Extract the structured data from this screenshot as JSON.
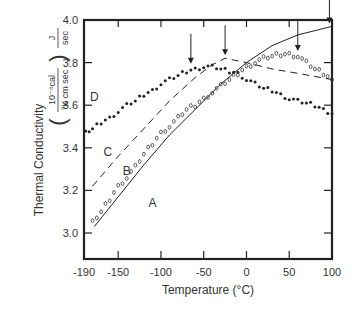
{
  "chart_data": {
    "type": "line",
    "title": "",
    "xlabel": "Temperature (°C)",
    "ylabel": "Thermal Conductivity",
    "ylabel_units": [
      "10⁻⁶cal",
      "°K cm sec"
    ],
    "ylabel_extra": "J / sec",
    "xlim": [
      -190,
      100
    ],
    "ylim": [
      2.9,
      4.0
    ],
    "xticks": [
      -190,
      -150,
      -100,
      -50,
      0,
      50,
      100
    ],
    "yticks": [
      3.0,
      3.2,
      3.4,
      3.6,
      3.8,
      4.0
    ],
    "grid": false,
    "series": [
      {
        "name": "A",
        "style": "solid",
        "x": [
          -178,
          -150,
          -120,
          -90,
          -60,
          -30,
          0,
          30,
          60,
          100
        ],
        "y": [
          3.03,
          3.17,
          3.32,
          3.46,
          3.58,
          3.7,
          3.8,
          3.88,
          3.93,
          3.97
        ]
      },
      {
        "name": "B",
        "style": "open-circles",
        "x": [
          -180,
          -170,
          -160,
          -150,
          -140,
          -130,
          -120,
          -110,
          -100,
          -90,
          -80,
          -70,
          -60,
          -50,
          -40,
          -30,
          -20,
          -10,
          0,
          10,
          20,
          30,
          40,
          50,
          60,
          70,
          80,
          90,
          100
        ],
        "y": [
          3.05,
          3.1,
          3.16,
          3.22,
          3.26,
          3.31,
          3.37,
          3.42,
          3.47,
          3.5,
          3.54,
          3.58,
          3.6,
          3.63,
          3.66,
          3.69,
          3.72,
          3.75,
          3.78,
          3.8,
          3.82,
          3.83,
          3.84,
          3.84,
          3.83,
          3.8,
          3.77,
          3.75,
          3.72
        ]
      },
      {
        "name": "C",
        "style": "dashed",
        "x": [
          -180,
          -150,
          -120,
          -90,
          -60,
          -40,
          -25,
          0,
          30,
          60,
          100
        ],
        "y": [
          3.22,
          3.36,
          3.49,
          3.62,
          3.73,
          3.79,
          3.82,
          3.8,
          3.77,
          3.75,
          3.72
        ]
      },
      {
        "name": "D",
        "style": "filled-dots",
        "x": [
          -188,
          -180,
          -170,
          -160,
          -150,
          -140,
          -130,
          -120,
          -110,
          -100,
          -90,
          -80,
          -70,
          -60,
          -50,
          -40,
          -30,
          -20,
          -10,
          0,
          10,
          20,
          30,
          40,
          50,
          60,
          70,
          80,
          90,
          100
        ],
        "y": [
          3.47,
          3.49,
          3.52,
          3.54,
          3.57,
          3.6,
          3.62,
          3.65,
          3.67,
          3.7,
          3.72,
          3.74,
          3.76,
          3.77,
          3.78,
          3.78,
          3.77,
          3.76,
          3.75,
          3.72,
          3.7,
          3.68,
          3.67,
          3.65,
          3.63,
          3.62,
          3.61,
          3.6,
          3.58,
          3.56
        ]
      }
    ],
    "annotations": [
      {
        "type": "arrow",
        "x": -65,
        "y": 3.78,
        "note": "peak D"
      },
      {
        "type": "arrow",
        "x": -25,
        "y": 3.82,
        "note": "peak C"
      },
      {
        "type": "arrow",
        "x": 60,
        "y": 3.84,
        "note": "peak B"
      },
      {
        "type": "arrow",
        "x": 97,
        "y": 3.97,
        "note": "A"
      }
    ],
    "series_labels": [
      {
        "text": "A",
        "x": -110,
        "y": 3.12
      },
      {
        "text": "B",
        "x": -140,
        "y": 3.27
      },
      {
        "text": "C",
        "x": -162,
        "y": 3.36
      },
      {
        "text": "D",
        "x": -178,
        "y": 3.62
      }
    ]
  }
}
